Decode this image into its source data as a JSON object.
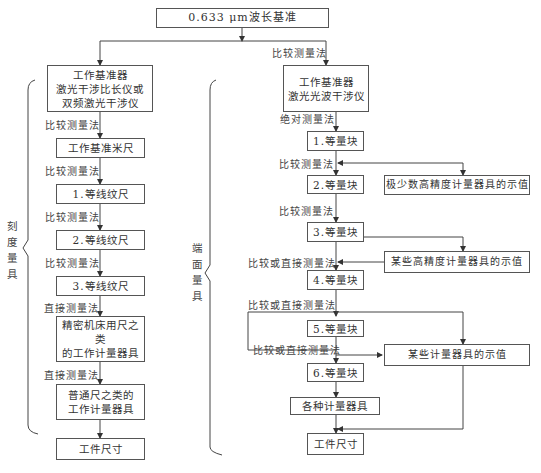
{
  "root": {
    "label": "0.633 μm波长基准"
  },
  "left": {
    "side_label": [
      "刻",
      "度",
      "量",
      "具"
    ],
    "boxes": [
      {
        "lines": [
          "工作基准器",
          "激光干涉比长仪或",
          "双频激光干涉仪"
        ]
      },
      {
        "lines": [
          "工作基准米尺"
        ]
      },
      {
        "lines": [
          "1.等线纹尺"
        ]
      },
      {
        "lines": [
          "2.等线纹尺"
        ]
      },
      {
        "lines": [
          "3.等线纹尺"
        ]
      },
      {
        "lines": [
          "精密机床用尺之类",
          "的工作计量器具"
        ]
      },
      {
        "lines": [
          "普通尺之类的",
          "工作计量器具"
        ]
      },
      {
        "lines": [
          "工件尺寸"
        ]
      }
    ],
    "edge_labels": [
      "比较测量法",
      "比较测量法",
      "比较测量法",
      "比较测量法",
      "直接测量法",
      "直接测量法"
    ]
  },
  "right": {
    "side_label": [
      "端",
      "面",
      "量",
      "具"
    ],
    "top_edge_label": "比较测量法",
    "boxes": [
      {
        "lines": [
          "工作基准器",
          "激光光波干涉仪"
        ]
      },
      {
        "lines": [
          "1.等量块"
        ]
      },
      {
        "lines": [
          "2.等量块"
        ]
      },
      {
        "lines": [
          "3.等量块"
        ]
      },
      {
        "lines": [
          "4.等量块"
        ]
      },
      {
        "lines": [
          "5.等量块"
        ]
      },
      {
        "lines": [
          "6.等量块"
        ]
      },
      {
        "lines": [
          "各种计量器具"
        ]
      },
      {
        "lines": [
          "工件尺寸"
        ]
      }
    ],
    "edge_labels": [
      "绝对测量法",
      "比较测量法",
      "比较测量法",
      "比较或直接测量法",
      "比较或直接测量法",
      "比较或直接测量法"
    ],
    "side_boxes": [
      {
        "label": "极少数高精度计量器具的示值"
      },
      {
        "label": "某些高精度计量器具的示值"
      },
      {
        "label": "某些计量器具的示值"
      }
    ]
  }
}
